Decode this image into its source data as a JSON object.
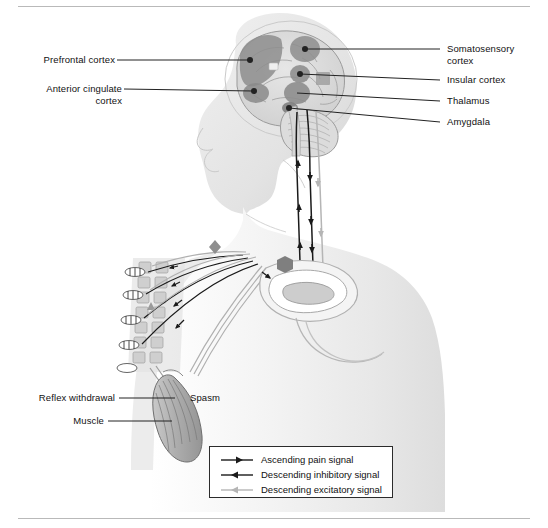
{
  "figure": {
    "rules": {
      "top": true,
      "bottom": true
    }
  },
  "labels": {
    "left": [
      {
        "id": "prefrontal-cortex",
        "text": "Prefrontal cortex",
        "align": "right"
      },
      {
        "id": "anterior-cingulate-cortex-line1",
        "text": "Anterior cingulate",
        "align": "right"
      },
      {
        "id": "anterior-cingulate-cortex-line2",
        "text": "cortex",
        "align": "right"
      },
      {
        "id": "reflex-withdrawal",
        "text": "Reflex withdrawal",
        "align": "right"
      },
      {
        "id": "muscle",
        "text": "Muscle",
        "align": "right"
      }
    ],
    "right": [
      {
        "id": "somatosensory-cortex-line1",
        "text": "Somatosensory",
        "align": "left"
      },
      {
        "id": "somatosensory-cortex-line2",
        "text": "cortex",
        "align": "left"
      },
      {
        "id": "insular-cortex",
        "text": "Insular cortex",
        "align": "left"
      },
      {
        "id": "thalamus",
        "text": "Thalamus",
        "align": "left"
      },
      {
        "id": "amygdala",
        "text": "Amygdala",
        "align": "left"
      }
    ],
    "inline": [
      {
        "id": "spasm",
        "text": "Spasm"
      }
    ]
  },
  "legend": {
    "items": [
      {
        "id": "ascending-pain-signal",
        "label": "Ascending pain signal",
        "marker": "arrow-right-dark",
        "color": "#1a1a1a"
      },
      {
        "id": "descending-inhibitory-signal",
        "label": "Descending inhibitory signal",
        "marker": "arrow-left-dark",
        "color": "#1a1a1a"
      },
      {
        "id": "descending-excitatory-signal",
        "label": "Descending excitatory signal",
        "marker": "arrow-left-light",
        "color": "#b5b5b5"
      }
    ]
  },
  "colors": {
    "body_fill": "#f2f2f2",
    "body_shade": "#e2e2e2",
    "body_outline": "#c9c9c9",
    "brain_fill": "#dcdcdc",
    "brain_outline": "#8a8a8a",
    "region_dark": "#8e8e8e",
    "region_mid": "#a9a9a9",
    "tract_dark": "#1a1a1a",
    "tract_light": "#b5b5b5",
    "leader_line": "#222222",
    "rule": "#b9b9b9",
    "legend_border": "#2b2b2b"
  }
}
